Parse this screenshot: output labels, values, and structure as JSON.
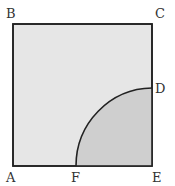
{
  "diagram": {
    "type": "geometry",
    "colors": {
      "square_fill": "#e6e6e6",
      "sector_fill": "#cfcfcf",
      "stroke": "#222222",
      "label": "#333333"
    },
    "points": {
      "A": {
        "label": "A",
        "x": 13,
        "y": 166
      },
      "B": {
        "label": "B",
        "x": 13,
        "y": 24
      },
      "C": {
        "label": "C",
        "x": 152,
        "y": 24
      },
      "D": {
        "label": "D",
        "x": 152,
        "y": 88
      },
      "E": {
        "label": "E",
        "x": 152,
        "y": 166
      },
      "F": {
        "label": "F",
        "x": 76,
        "y": 166
      }
    },
    "labels": {
      "A": "A",
      "B": "B",
      "C": "C",
      "D": "D",
      "E": "E",
      "F": "F"
    },
    "shapes": {
      "square": "ABCE",
      "arc": {
        "from": "F",
        "to": "D",
        "center": "E",
        "radius": 77
      }
    }
  }
}
